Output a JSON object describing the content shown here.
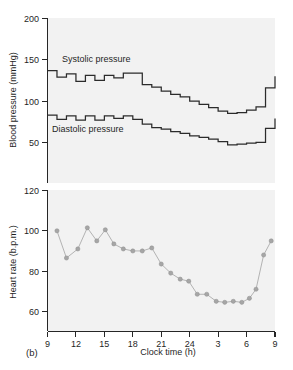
{
  "figure": {
    "panel_caption": "(b)",
    "background_color": "#f2f2f2",
    "line_color": "#2b2b2b",
    "marker_color": "#a6a6a6"
  },
  "chart_data": [
    {
      "type": "line",
      "title": "",
      "subtitle": "",
      "panel": "top",
      "xlabel": "",
      "ylabel": "Blood pressure (mmHg)",
      "ylim": [
        40,
        200
      ],
      "yticks": [
        50,
        100,
        150,
        200
      ],
      "ytick_labels": [
        "50",
        "100",
        "150",
        "200"
      ],
      "xlim": [
        9,
        33
      ],
      "xticks": [
        9,
        12,
        15,
        18,
        21,
        24,
        27,
        30,
        33
      ],
      "xtick_labels": [
        "9",
        "12",
        "15",
        "18",
        "21",
        "24",
        "3",
        "6",
        "9"
      ],
      "grid": false,
      "legend_position": "inline-annotation",
      "drawstyle": "steps-post",
      "annotations": [
        {
          "text": "Systolic pressure",
          "x": 10.2,
          "y": 150
        },
        {
          "text": "Diastolic pressure",
          "x": 10.2,
          "y": 64
        }
      ],
      "x": [
        9.0,
        10.0,
        11.0,
        12.0,
        13.0,
        14.0,
        15.0,
        16.0,
        17.0,
        18.0,
        19.0,
        20.0,
        21.0,
        22.0,
        23.0,
        24.0,
        25.0,
        26.0,
        27.0,
        28.0,
        29.0,
        30.0,
        31.0,
        32.0,
        33.0
      ],
      "series": [
        {
          "name": "Systolic pressure",
          "values": [
            137,
            129,
            133,
            124,
            131,
            125,
            131,
            128,
            134,
            134,
            120,
            117,
            112,
            108,
            105,
            100,
            96,
            92,
            88,
            85,
            86,
            89,
            93,
            116,
            130
          ]
        },
        {
          "name": "Diastolic pressure",
          "values": [
            83,
            78,
            82,
            77,
            82,
            77,
            82,
            79,
            82,
            78,
            72,
            68,
            66,
            63,
            61,
            58,
            56,
            54,
            51,
            47,
            48,
            49,
            50,
            67,
            79
          ]
        }
      ]
    },
    {
      "type": "scatter",
      "title": "",
      "panel": "bottom",
      "xlabel": "Clock time (h)",
      "ylabel": "Heart rate (b.p.m.)",
      "ylim": [
        50,
        120
      ],
      "yticks": [
        60,
        80,
        100,
        120
      ],
      "ytick_labels": [
        "60",
        "80",
        "100",
        "120"
      ],
      "xlim": [
        9,
        33
      ],
      "xticks": [
        9,
        12,
        15,
        18,
        21,
        24,
        27,
        30,
        33
      ],
      "xtick_labels": [
        "9",
        "12",
        "15",
        "18",
        "21",
        "24",
        "3",
        "6",
        "9"
      ],
      "grid": false,
      "legend_position": "none",
      "series": [
        {
          "name": "Heart rate",
          "x": [
            10.0,
            11.0,
            12.2,
            13.2,
            14.2,
            15.1,
            16.0,
            17.0,
            18.0,
            19.0,
            20.0,
            21.0,
            22.0,
            23.0,
            23.9,
            24.8,
            25.8,
            26.8,
            27.7,
            28.6,
            29.5,
            30.3,
            31.0,
            31.8,
            32.6
          ],
          "values": [
            100,
            86.5,
            91,
            101.5,
            95,
            100.5,
            93.5,
            91,
            90,
            90,
            91.5,
            83.5,
            79,
            76,
            75,
            68.5,
            68.5,
            65,
            64.5,
            65,
            64.5,
            66.5,
            71,
            88,
            95
          ]
        }
      ]
    }
  ]
}
